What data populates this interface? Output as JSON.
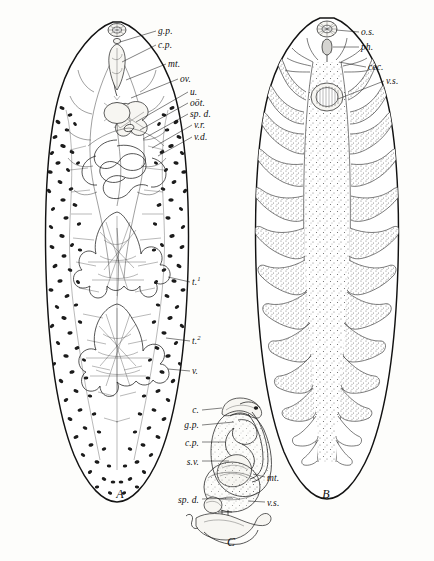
{
  "plate": {
    "title": "Liver fluke anatomy plate",
    "background_color": "#fdfdfb",
    "ink_color": "#131313",
    "figures": [
      {
        "letter": "A",
        "name": "reproductive-system",
        "letter_x": 120,
        "letter_y": 498
      },
      {
        "letter": "B",
        "name": "digestive-system",
        "letter_x": 326,
        "letter_y": 498
      },
      {
        "letter": "C",
        "name": "terminal-genitalia-detail",
        "letter_x": 231,
        "letter_y": 546
      }
    ]
  },
  "figure_a": {
    "letter": "A",
    "labels": [
      {
        "key": "gp",
        "text": "g.p.",
        "x": 158,
        "y": 34,
        "anchor": "start",
        "lead": [
          [
            156,
            31
          ],
          [
            120,
            42
          ]
        ]
      },
      {
        "key": "cp",
        "text": "c.p.",
        "x": 158,
        "y": 48,
        "anchor": "start",
        "lead": [
          [
            156,
            45
          ],
          [
            122,
            62
          ]
        ]
      },
      {
        "key": "mt",
        "text": "mt.",
        "x": 168,
        "y": 67,
        "anchor": "start",
        "lead": [
          [
            166,
            64
          ],
          [
            126,
            80
          ]
        ]
      },
      {
        "key": "ov",
        "text": "ov.",
        "x": 180,
        "y": 82,
        "anchor": "start",
        "lead": [
          [
            178,
            79
          ],
          [
            131,
            98
          ]
        ]
      },
      {
        "key": "u",
        "text": "u.",
        "x": 190,
        "y": 95,
        "anchor": "start",
        "lead": [
          [
            188,
            92
          ],
          [
            136,
            122
          ]
        ]
      },
      {
        "key": "oot",
        "text": "oöt.",
        "x": 190,
        "y": 106,
        "anchor": "start",
        "lead": [
          [
            188,
            103
          ],
          [
            140,
            130
          ]
        ]
      },
      {
        "key": "spd",
        "text": "sp. d.",
        "x": 190,
        "y": 117,
        "anchor": "start",
        "lead": [
          [
            188,
            114
          ],
          [
            143,
            139
          ]
        ]
      },
      {
        "key": "vr",
        "text": "v.r.",
        "x": 194,
        "y": 128,
        "anchor": "start",
        "lead": [
          [
            192,
            125
          ],
          [
            152,
            148
          ]
        ]
      },
      {
        "key": "vd",
        "text": "v.d.",
        "x": 194,
        "y": 140,
        "anchor": "start",
        "lead": [
          [
            192,
            137
          ],
          [
            158,
            156
          ]
        ]
      },
      {
        "key": "t1",
        "text": "t.",
        "sup": "1",
        "x": 192,
        "y": 285,
        "anchor": "start",
        "lead": [
          [
            190,
            282
          ],
          [
            168,
            277
          ]
        ]
      },
      {
        "key": "t2",
        "text": "t.",
        "sup": "2",
        "x": 192,
        "y": 344,
        "anchor": "start",
        "lead": [
          [
            190,
            341
          ],
          [
            166,
            338
          ]
        ]
      },
      {
        "key": "v",
        "text": "v.",
        "x": 192,
        "y": 374,
        "anchor": "start",
        "lead": [
          [
            190,
            371
          ],
          [
            168,
            369
          ]
        ]
      }
    ]
  },
  "figure_b": {
    "letter": "B",
    "labels": [
      {
        "key": "os",
        "text": "o.s.",
        "x": 361,
        "y": 35,
        "anchor": "start",
        "lead": [
          [
            359,
            32
          ],
          [
            332,
            30
          ]
        ]
      },
      {
        "key": "ph",
        "text": "ph.",
        "x": 361,
        "y": 50,
        "anchor": "start",
        "lead": [
          [
            359,
            47
          ],
          [
            330,
            48
          ]
        ]
      },
      {
        "key": "cec",
        "text": "cec.",
        "x": 368,
        "y": 70,
        "anchor": "start",
        "lead": [
          [
            366,
            67
          ],
          [
            339,
            62
          ]
        ]
      },
      {
        "key": "vs",
        "text": "v.s.",
        "x": 386,
        "y": 84,
        "anchor": "start",
        "lead": [
          [
            384,
            81
          ],
          [
            330,
            97
          ]
        ]
      }
    ]
  },
  "figure_c": {
    "letter": "C",
    "labels": [
      {
        "key": "c",
        "text": "c.",
        "x": 199,
        "y": 413,
        "anchor": "end",
        "lead": [
          [
            202,
            410
          ],
          [
            222,
            408
          ]
        ]
      },
      {
        "key": "gp",
        "text": "g.p.",
        "x": 199,
        "y": 428,
        "anchor": "end",
        "lead": [
          [
            202,
            425
          ],
          [
            232,
            424
          ]
        ]
      },
      {
        "key": "cp",
        "text": "c.p.",
        "x": 199,
        "y": 446,
        "anchor": "end",
        "lead": [
          [
            202,
            443
          ],
          [
            227,
            443
          ]
        ]
      },
      {
        "key": "sv",
        "text": "s.v.",
        "x": 199,
        "y": 465,
        "anchor": "end",
        "lead": [
          [
            202,
            462
          ],
          [
            230,
            462
          ]
        ]
      },
      {
        "key": "spd",
        "text": "sp. d.",
        "x": 199,
        "y": 503,
        "anchor": "end",
        "lead": [
          [
            202,
            500
          ],
          [
            232,
            499
          ]
        ]
      },
      {
        "key": "mt",
        "text": "mt.",
        "x": 267,
        "y": 481,
        "anchor": "start",
        "lead": [
          [
            265,
            478
          ],
          [
            252,
            475
          ]
        ]
      },
      {
        "key": "vs",
        "text": "v.s.",
        "x": 267,
        "y": 506,
        "anchor": "start",
        "lead": [
          [
            265,
            503
          ],
          [
            248,
            502
          ]
        ]
      }
    ]
  },
  "legend_keys": {
    "c": "cirrus",
    "cec": "cecum",
    "cp": "cirrus pouch",
    "gp": "genital pore",
    "mt": "metraterm",
    "oot": "oötype",
    "os": "oral sucker",
    "ov": "ovary",
    "ph": "pharynx",
    "spd": "sperm duct",
    "sv": "seminal vesicle",
    "t1": "anterior testis",
    "t2": "posterior testis",
    "u": "uterus",
    "v": "vitellaria",
    "vd": "vitelline duct",
    "vr": "vitelline reservoir",
    "vs": "ventral sucker"
  }
}
